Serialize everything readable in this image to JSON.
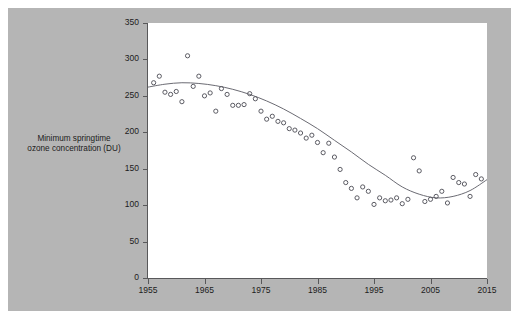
{
  "chart_data": {
    "type": "scatter",
    "title": "",
    "xlabel": "",
    "ylabel": "Minimum springtime ozone concentration (DU)",
    "ylabel_line1": "Minimum springtime",
    "ylabel_line2": "ozone concentration (DU)",
    "xlim": [
      1955,
      2015
    ],
    "ylim": [
      0,
      350
    ],
    "xticks": [
      1955,
      1965,
      1975,
      1985,
      1995,
      2005,
      2015
    ],
    "yticks": [
      0,
      50,
      100,
      150,
      200,
      250,
      300,
      350
    ],
    "grid": false,
    "legend": "none",
    "marker_style": "open-circle",
    "marker_color": "#5b5b63",
    "trend_line_color": "#6b6b73",
    "panel_background": "#b5b5b5",
    "plot_background": "#ffffff",
    "series": [
      {
        "name": "Minimum springtime ozone concentration",
        "x": [
          1956,
          1957,
          1958,
          1959,
          1960,
          1961,
          1962,
          1963,
          1964,
          1965,
          1966,
          1967,
          1968,
          1969,
          1970,
          1971,
          1972,
          1973,
          1974,
          1975,
          1976,
          1977,
          1978,
          1979,
          1980,
          1981,
          1982,
          1983,
          1984,
          1985,
          1986,
          1987,
          1988,
          1989,
          1990,
          1991,
          1992,
          1993,
          1994,
          1995,
          1996,
          1997,
          1998,
          1999,
          2000,
          2001,
          2002,
          2003,
          2004,
          2005,
          2006,
          2007,
          2008,
          2009,
          2010,
          2011,
          2012,
          2013,
          2014
        ],
        "y": [
          268,
          277,
          255,
          252,
          256,
          242,
          305,
          263,
          277,
          250,
          254,
          229,
          260,
          252,
          237,
          237,
          238,
          253,
          246,
          229,
          218,
          222,
          215,
          213,
          205,
          203,
          199,
          192,
          196,
          186,
          172,
          185,
          166,
          149,
          131,
          123,
          110,
          125,
          119,
          101,
          110,
          106,
          107,
          110,
          102,
          108,
          165,
          147,
          105,
          108,
          112,
          119,
          103,
          138,
          131,
          129,
          112,
          142,
          136
        ]
      }
    ],
    "trend": {
      "name": "fitted smooth trend",
      "x": [
        1955,
        1958,
        1961,
        1964,
        1967,
        1970,
        1973,
        1976,
        1979,
        1982,
        1985,
        1988,
        1991,
        1994,
        1997,
        2000,
        2003,
        2006,
        2009,
        2012,
        2015
      ],
      "y": [
        262,
        266,
        268,
        267,
        264,
        259,
        252,
        243,
        232,
        219,
        205,
        189,
        173,
        156,
        141,
        125,
        115,
        110,
        112,
        120,
        135
      ]
    }
  }
}
